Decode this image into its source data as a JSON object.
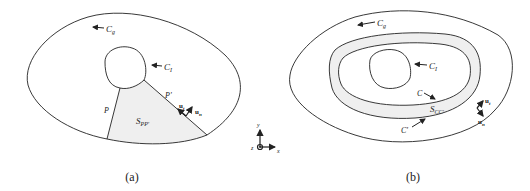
{
  "panel_a": {
    "caption": "(a)",
    "labels": {
      "outer_contour": "C",
      "outer_contour_sub": "g",
      "inner_contour": "C",
      "inner_contour_sub": "I",
      "path_left": "P",
      "path_right": "P'",
      "region": "S",
      "region_sub": "PP'",
      "tangent_vector": "u",
      "tangent_sub": "t",
      "normal_vector": "u",
      "normal_sub": "n"
    }
  },
  "panel_b": {
    "caption": "(b)",
    "labels": {
      "outer_contour": "C",
      "outer_contour_sub": "g",
      "inner_contour": "C",
      "inner_contour_sub": "I",
      "contour_c": "C",
      "contour_c_prime": "C'",
      "region": "S",
      "region_sub": "CC'",
      "tangent_vector": "u",
      "tangent_sub": "t",
      "normal_vector": "u",
      "normal_sub": "n"
    }
  },
  "axes": {
    "y_label": "y",
    "x_label": "x",
    "z_label": "z"
  },
  "colors": {
    "line": "#222222",
    "shaded_region": "#efefef"
  }
}
